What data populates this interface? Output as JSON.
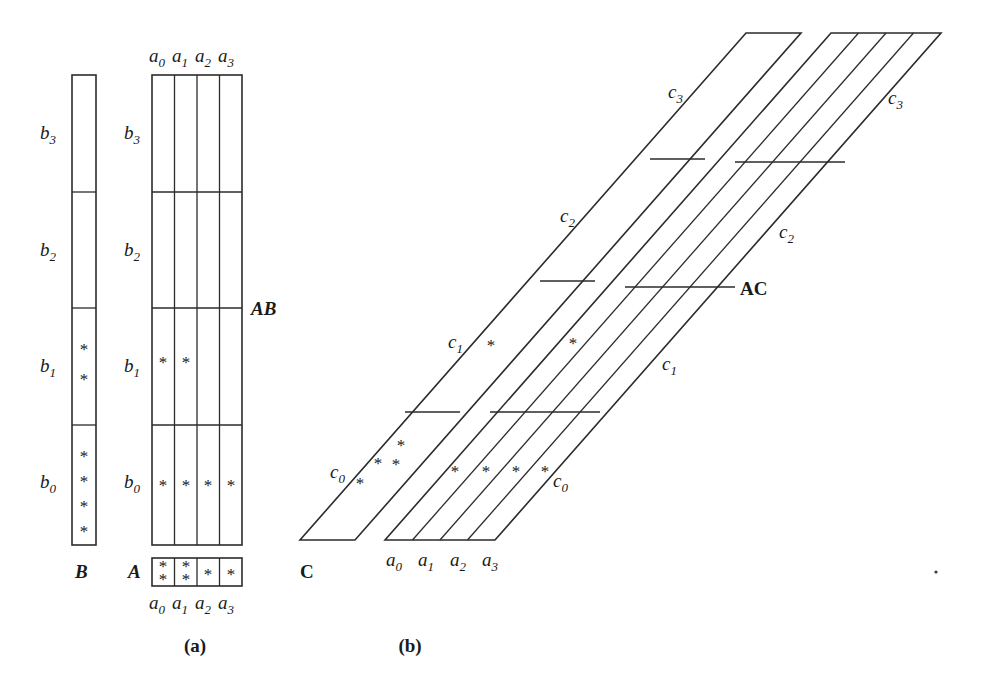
{
  "figure": {
    "panels": [
      {
        "id": "a",
        "caption": "(a)"
      },
      {
        "id": "b",
        "caption": "(b)"
      }
    ],
    "asterisk_glyph": "*",
    "stroke_color": "#2b2b2b",
    "background_color": "#ffffff"
  },
  "panel_a": {
    "matrix_b": {
      "name": "B",
      "label": "B",
      "row_labels": [
        "b",
        "b",
        "b",
        "b"
      ],
      "row_subscripts": [
        "3",
        "2",
        "1",
        "0"
      ],
      "rows": [
        {
          "label": "b",
          "sub": "3",
          "asterisks": 0
        },
        {
          "label": "b",
          "sub": "2",
          "asterisks": 0
        },
        {
          "label": "b",
          "sub": "1",
          "asterisks": 2
        },
        {
          "label": "b",
          "sub": "0",
          "asterisks": 4
        }
      ]
    },
    "matrix_ab": {
      "name": "AB",
      "label": "AB",
      "col_label": "a",
      "col_subscripts": [
        "0",
        "1",
        "2",
        "3"
      ],
      "col_labels": [
        "a",
        "a",
        "a",
        "a"
      ],
      "row_labels": [
        "b",
        "b",
        "b",
        "b"
      ],
      "row_subscripts": [
        "3",
        "2",
        "1",
        "0"
      ],
      "cells": [
        {
          "row": "b",
          "sub": "3",
          "counts": [
            0,
            0,
            0,
            0
          ]
        },
        {
          "row": "b",
          "sub": "2",
          "counts": [
            0,
            0,
            0,
            0
          ]
        },
        {
          "row": "b",
          "sub": "1",
          "counts": [
            1,
            1,
            0,
            0
          ]
        },
        {
          "row": "b",
          "sub": "0",
          "counts": [
            1,
            1,
            1,
            1
          ]
        }
      ]
    },
    "vector_a": {
      "name": "A",
      "label": "A",
      "col_label": "a",
      "col_subscripts": [
        "0",
        "1",
        "2",
        "3"
      ],
      "counts": [
        2,
        2,
        1,
        1
      ]
    }
  },
  "panel_b": {
    "matrix_c": {
      "name": "C",
      "label": "C",
      "band_label": "c",
      "band_subscripts": [
        "3",
        "2",
        "1",
        "0"
      ],
      "bands": [
        {
          "label": "c",
          "sub": "3",
          "asterisks": 0
        },
        {
          "label": "c",
          "sub": "2",
          "asterisks": 0
        },
        {
          "label": "c",
          "sub": "1",
          "asterisks": 1
        },
        {
          "label": "c",
          "sub": "0",
          "asterisks": 4
        }
      ]
    },
    "matrix_ac": {
      "name": "AC",
      "label": "AC",
      "band_label": "c",
      "band_subscripts": [
        "3",
        "2",
        "1",
        "0"
      ],
      "col_label": "a",
      "col_subscripts": [
        "0",
        "1",
        "2",
        "3"
      ],
      "bands": [
        {
          "label": "c",
          "sub": "3",
          "counts": [
            0,
            0,
            0,
            0
          ]
        },
        {
          "label": "c",
          "sub": "2",
          "counts": [
            0,
            0,
            0,
            0
          ]
        },
        {
          "label": "c",
          "sub": "1",
          "counts": [
            1,
            0,
            0,
            0
          ]
        },
        {
          "label": "c",
          "sub": "0",
          "counts": [
            1,
            1,
            1,
            1
          ]
        }
      ]
    }
  }
}
